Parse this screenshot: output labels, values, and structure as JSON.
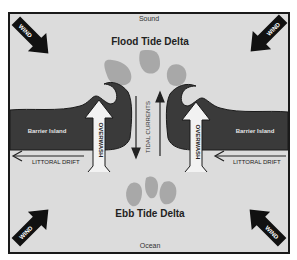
{
  "diagram": {
    "labels": {
      "sound": "Sound",
      "ocean": "Ocean",
      "flood_tide_delta": "Flood Tide Delta",
      "ebb_tide_delta": "Ebb Tide Delta",
      "tidal_currents": "TIDAL CURRENTS",
      "barrier_island_left": "Barrier Island",
      "barrier_island_right": "Barrier Island",
      "littoral_drift_left": "LITTORAL DRIFT",
      "littoral_drift_right": "LITTORAL DRIFT",
      "overwash_left": "OVERWASH",
      "overwash_right": "OVERWASH",
      "wind_top_left": "WIND",
      "wind_top_right": "WIND",
      "wind_bottom_left": "WIND",
      "wind_bottom_right": "WIND"
    },
    "colors": {
      "background": "#dcdcdc",
      "frame": "#1a1a1a",
      "island": "#3a3a3a",
      "delta_blob": "#a8a8a8",
      "wind_arrow": "#111111",
      "overwash_arrow_fill": "#f2f2f2"
    }
  }
}
